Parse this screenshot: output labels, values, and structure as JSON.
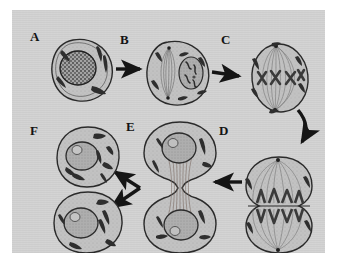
{
  "figure": {
    "background_color": "#d3d3d3",
    "margin_color": "#ffffff",
    "ink_color": "#1a1a1a",
    "style": "grayscale line drawing",
    "panel": {
      "x": 12,
      "y": 10,
      "width": 313,
      "height": 243
    }
  },
  "labels": [
    {
      "id": "A",
      "text": "A",
      "x": 28,
      "y": 30,
      "stage": "interphase / prophase onset"
    },
    {
      "id": "B",
      "text": "B",
      "x": 120,
      "y": 33,
      "stage": "prophase"
    },
    {
      "id": "C",
      "text": "C",
      "x": 221,
      "y": 33,
      "stage": "metaphase"
    },
    {
      "id": "D",
      "text": "D",
      "x": 219,
      "y": 124,
      "stage": "anaphase"
    },
    {
      "id": "E",
      "text": "E",
      "x": 126,
      "y": 120,
      "stage": "telophase / cytokinesis"
    },
    {
      "id": "F",
      "text": "F",
      "x": 28,
      "y": 124,
      "stage": "two daughter cells"
    }
  ],
  "cells": [
    {
      "id": "A",
      "label": "A",
      "center": {
        "x": 73,
        "y": 60
      },
      "radius": 31,
      "description": "Round cell with large granular nucleus and dark curved mitochondria in the cytoplasm",
      "features": [
        "cell membrane",
        "nucleus",
        "chromatin granules",
        "mitochondria"
      ],
      "chromosome_count": 0
    },
    {
      "id": "B",
      "label": "B",
      "center": {
        "x": 168,
        "y": 63
      },
      "radius": 31,
      "description": "Prophase: spindle forming at left, nucleus at right containing condensed chromosomes",
      "features": [
        "forming spindle",
        "centrosome poles",
        "nuclear envelope",
        "condensed chromosomes",
        "mitochondria"
      ],
      "chromosome_count": 4
    },
    {
      "id": "C",
      "label": "C",
      "center": {
        "x": 268,
        "y": 68
      },
      "radius": 32,
      "description": "Metaphase: X-shaped chromosomes aligned on the equatorial plate with full spindle between two poles",
      "features": [
        "spindle fibers",
        "two poles",
        "metaphase plate",
        "X-shaped chromosomes",
        "mitochondria"
      ],
      "chromosome_count": 4
    },
    {
      "id": "D",
      "label": "D",
      "center": {
        "x": 267,
        "y": 183
      },
      "radius": 34,
      "description": "Anaphase: V-shaped chromatids moving toward opposite poles, cell beginning to divide at equator",
      "features": [
        "separating chromatids",
        "V-shaped chromosomes",
        "spindle fibers",
        "equatorial furrow line"
      ],
      "chromosome_count": 8
    },
    {
      "id": "E",
      "label": "E",
      "center": {
        "x": 168,
        "y": 182
      },
      "radius": 34,
      "description": "Telophase and cytokinesis: dumbbell-shaped cell with two reforming daughter nuclei joined by a narrow midbody of fibers",
      "features": [
        "cleavage furrow",
        "midbody fibers",
        "two daughter nuclei",
        "mitochondria"
      ],
      "chromosome_count": 0
    },
    {
      "id": "F1",
      "label": "F",
      "center": {
        "x": 76,
        "y": 150
      },
      "radius": 27,
      "description": "Upper daughter cell with nucleus and nucleolus",
      "features": [
        "nucleus",
        "nucleolus",
        "mitochondria"
      ],
      "chromosome_count": 0
    },
    {
      "id": "F2",
      "label": "F",
      "center": {
        "x": 76,
        "y": 210
      },
      "radius": 28,
      "description": "Lower daughter cell with nucleus and nucleolus",
      "features": [
        "nucleus",
        "nucleolus",
        "mitochondria"
      ],
      "chromosome_count": 0
    }
  ],
  "arrows": [
    {
      "id": "a-to-b",
      "from": "A",
      "to": "B",
      "shape": "straight",
      "direction": "right"
    },
    {
      "id": "b-to-c",
      "from": "B",
      "to": "C",
      "shape": "straight",
      "direction": "right"
    },
    {
      "id": "c-to-d",
      "from": "C",
      "to": "D",
      "shape": "curved",
      "direction": "down-left"
    },
    {
      "id": "d-to-e",
      "from": "D",
      "to": "E",
      "shape": "straight",
      "direction": "left"
    },
    {
      "id": "e-to-f-upper",
      "from": "E",
      "to": "F",
      "shape": "straight",
      "direction": "up-left"
    },
    {
      "id": "e-to-f-lower",
      "from": "E",
      "to": "F",
      "shape": "straight",
      "direction": "down-left"
    }
  ]
}
